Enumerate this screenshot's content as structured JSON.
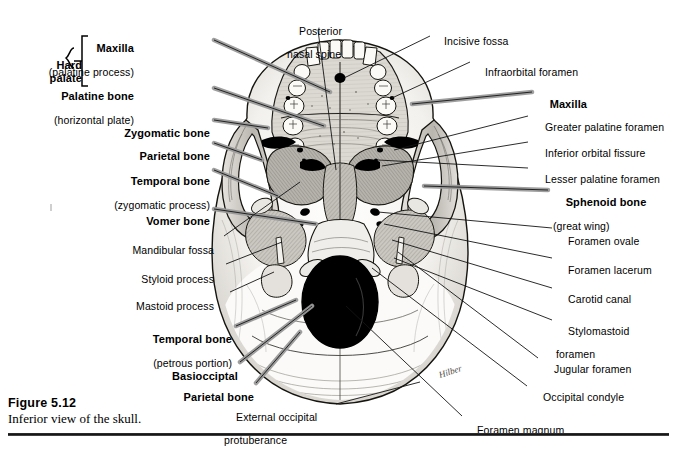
{
  "figure": {
    "caption_title": "Figure 5.12",
    "caption_text": "Inferior view of the skull.",
    "artist_signature": "Hilber"
  },
  "labels_left": [
    {
      "id": "hard-palate",
      "text": "Hard\npalate",
      "style": "bold",
      "x": 62,
      "y": 47
    },
    {
      "id": "maxilla-palatine-process",
      "main": "Maxilla",
      "sub": "(palatine process)",
      "style": "bold",
      "x": 96,
      "y": 30
    },
    {
      "id": "palatine-bone",
      "main": "Palatine bone",
      "sub": "(horizontal plate)",
      "style": "bold",
      "x": 96,
      "y": 78
    },
    {
      "id": "zygomatic-bone",
      "main": "Zygomatic bone",
      "style": "bold",
      "x": 117,
      "y": 115
    },
    {
      "id": "parietal-bone-upper",
      "main": "Parietal bone",
      "style": "bold",
      "x": 131,
      "y": 138
    },
    {
      "id": "temporal-bone-zygomatic",
      "main": "Temporal bone",
      "sub": "(zygomatic process)",
      "style": "bold",
      "x": 111,
      "y": 163
    },
    {
      "id": "vomer-bone",
      "main": "Vomer bone",
      "style": "bold",
      "x": 137,
      "y": 203
    },
    {
      "id": "mandibular-fossa",
      "main": "Mandibular fossa",
      "style": "plain",
      "x": 128,
      "y": 233
    },
    {
      "id": "styloid-process",
      "main": "Styloid process",
      "style": "plain",
      "x": 137,
      "y": 262
    },
    {
      "id": "mastoid-process",
      "main": "Mastoid process",
      "style": "plain",
      "x": 133,
      "y": 289
    },
    {
      "id": "temporal-bone-petrous",
      "main": "Temporal bone",
      "sub": "(petrous portion)",
      "style": "bold",
      "x": 131,
      "y": 321
    },
    {
      "id": "basioccipital",
      "main": "Basiocciptal",
      "style": "bold",
      "x": 162,
      "y": 358
    },
    {
      "id": "parietal-bone-lower",
      "main": "Parietal bone",
      "style": "bold",
      "x": 178,
      "y": 379
    },
    {
      "id": "external-occipital-protuberance",
      "main": "External occipital",
      "sub": "protuberance",
      "style": "plain",
      "x": 224,
      "y": 400
    }
  ],
  "labels_top": [
    {
      "id": "posterior-nasal-spine",
      "main": "Posterior",
      "sub": "nasal spine",
      "style": "plain",
      "x": 287,
      "y": 14
    },
    {
      "id": "incisive-fossa",
      "main": "Incisive fossa",
      "style": "plain",
      "x": 432,
      "y": 24
    }
  ],
  "labels_right": [
    {
      "id": "infraorbital-foramen",
      "main": "Infraorbital foramen",
      "style": "plain",
      "x": 473,
      "y": 55
    },
    {
      "id": "maxilla-right",
      "main": "Maxilla",
      "style": "bold",
      "x": 537,
      "y": 90
    },
    {
      "id": "greater-palatine-foramen",
      "main": "Greater palatine foramen",
      "style": "plain",
      "x": 533,
      "y": 113
    },
    {
      "id": "inferior-orbital-fissure",
      "main": "Inferior orbital fissure",
      "style": "plain",
      "x": 533,
      "y": 139
    },
    {
      "id": "lesser-palatine-foramen",
      "main": "Lesser palatine foramen",
      "style": "plain",
      "x": 533,
      "y": 164
    },
    {
      "id": "sphenoid-bone",
      "main": "Sphenoid bone",
      "sub": "(great wing)",
      "style": "bold",
      "x": 553,
      "y": 187
    },
    {
      "id": "foramen-ovale",
      "main": "Foramen ovale",
      "style": "plain",
      "x": 556,
      "y": 229
    },
    {
      "id": "foramen-lacerum",
      "main": "Foramen lacerum",
      "style": "plain",
      "x": 556,
      "y": 258
    },
    {
      "id": "carotid-canal",
      "main": "Carotid canal",
      "style": "plain",
      "x": 556,
      "y": 286
    },
    {
      "id": "stylomastoid-foramen",
      "main": "Stylomastoid",
      "sub": "foramen",
      "style": "plain",
      "x": 556,
      "y": 319
    },
    {
      "id": "jugular-foramen",
      "main": "Jugular foramen",
      "style": "plain",
      "x": 542,
      "y": 357
    },
    {
      "id": "occipital-condyle",
      "main": "Occipital condyle",
      "style": "plain",
      "x": 531,
      "y": 384
    }
  ],
  "labels_bottom": [
    {
      "id": "foramen-magnum",
      "main": "Foramen magnum",
      "style": "plain",
      "x": 465,
      "y": 418
    }
  ],
  "colors": {
    "ink": "#000000",
    "leader_thin": "#1a1a1a",
    "leader_thick": "#8e8e8e",
    "bone_light": "#f2f0ec",
    "bone_mid": "#c9c6c0",
    "bone_dark": "#8f8c86",
    "foramen": "#000000",
    "rule": "#222222"
  }
}
